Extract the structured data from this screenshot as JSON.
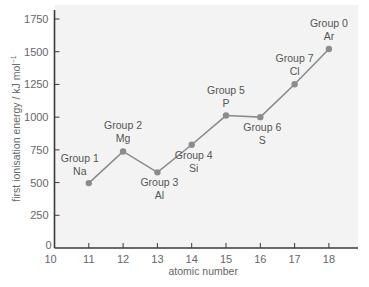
{
  "chart_data": {
    "type": "line",
    "title": "",
    "xlabel": "atomic number",
    "ylabel": "first ionisation energy / kJ mol⁻¹",
    "ylabel_main": "first ionisation energy / kJ mol",
    "ylabel_sup": "−1",
    "xlim": [
      10,
      18.8
    ],
    "ylim": [
      0,
      1800
    ],
    "x_ticks": [
      10,
      11,
      12,
      13,
      14,
      15,
      16,
      17,
      18
    ],
    "y_ticks": [
      0,
      250,
      500,
      750,
      1000,
      1250,
      1500,
      1750
    ],
    "grid": false,
    "legend": null,
    "series": [
      {
        "name": "first ionisation energy",
        "color": "#8c8c8c",
        "points": [
          {
            "x": 11,
            "y": 496,
            "group": "Group 1",
            "element": "Na",
            "label_pos": "left"
          },
          {
            "x": 12,
            "y": 738,
            "group": "Group 2",
            "element": "Mg",
            "label_pos": "above"
          },
          {
            "x": 13,
            "y": 578,
            "group": "Group 3",
            "element": "Al",
            "label_pos": "below"
          },
          {
            "x": 14,
            "y": 789,
            "group": "Group 4",
            "element": "Si",
            "label_pos": "below"
          },
          {
            "x": 15,
            "y": 1012,
            "group": "Group 5",
            "element": "P",
            "label_pos": "above"
          },
          {
            "x": 16,
            "y": 1000,
            "group": "Group 6",
            "element": "S",
            "label_pos": "below"
          },
          {
            "x": 17,
            "y": 1251,
            "group": "Group 7",
            "element": "Cl",
            "label_pos": "above"
          },
          {
            "x": 18,
            "y": 1521,
            "group": "Group 0",
            "element": "Ar",
            "label_pos": "above"
          }
        ]
      }
    ]
  },
  "colors": {
    "plot_background": "#f3f3f3",
    "axis": "#3a3a3a",
    "line": "#8c8c8c",
    "marker": "#8c8c8c",
    "text": "#555555"
  }
}
